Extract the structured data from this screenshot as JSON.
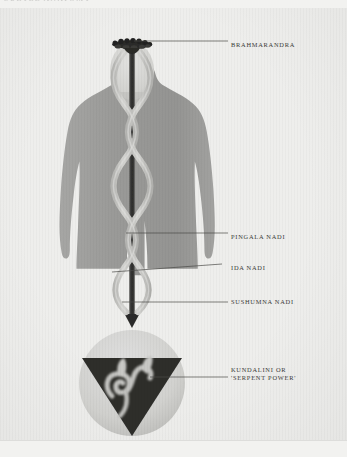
{
  "header": {
    "running_head": "SUBTLE ANATOMY"
  },
  "plate": {
    "title": "The subtle body: nadis and kundalini",
    "colors": {
      "page_background": "#f2f2f0",
      "plate_background": "#eeeeec",
      "body_silhouette": "#9a9a98",
      "head_fill": "#d6d6d4",
      "nadi_strand": "#c9c9c6",
      "sushumna_channel": "#3c3c3a",
      "chakra_circle": "#d4d4d1",
      "triangle": "#2e2e2c",
      "serpent": "#bdbdba",
      "crown_lotus": "#2a2a28",
      "leader_line": "#4a4a48",
      "label_text": "#3a3a38"
    }
  },
  "labels": [
    {
      "id": "brahmarandra",
      "name": "BRAHMARANDRA",
      "lines": [
        "BRAHMARANDRA"
      ],
      "x": 231,
      "y": 38,
      "leader_from_x": 134,
      "leader_from_y": 41,
      "leader_to_x": 228,
      "leader_to_y": 41
    },
    {
      "id": "pingala-nadi",
      "name": "PINGALA NADI",
      "lines": [
        "PINGALA NADI"
      ],
      "x": 231,
      "y": 230,
      "leader_from_x": 126,
      "leader_from_y": 233,
      "leader_to_x": 228,
      "leader_to_y": 233
    },
    {
      "id": "ida-nadi",
      "name": "IDA NADI",
      "lines": [
        "IDA NADI"
      ],
      "x": 231,
      "y": 264,
      "leader_from_x": 118,
      "leader_from_y": 272,
      "leader_to_x": 228,
      "leader_to_y": 266
    },
    {
      "id": "sushumna-nadi",
      "name": "SUSHUMNA NADI",
      "lines": [
        "SUSHUMNA NADI"
      ],
      "x": 231,
      "y": 299,
      "leader_from_x": 122,
      "leader_from_y": 302,
      "leader_to_x": 228,
      "leader_to_y": 302
    },
    {
      "id": "kundalini",
      "name": "KUNDALINI OR 'SERPENT POWER'",
      "lines": [
        "KUNDALINI OR",
        "'SERPENT POWER'"
      ],
      "x": 231,
      "y": 364,
      "leader_from_x": 150,
      "leader_from_y": 377,
      "leader_to_x": 228,
      "leader_to_y": 377
    }
  ],
  "figure": {
    "parts": [
      {
        "id": "body-silhouette",
        "label": "human body silhouette"
      },
      {
        "id": "head",
        "label": "head"
      },
      {
        "id": "crown-lotus",
        "label": "crown lotus at brahmarandra"
      },
      {
        "id": "sushumna",
        "label": "sushumna central channel"
      },
      {
        "id": "ida-strand",
        "label": "ida nadi helical strand"
      },
      {
        "id": "pingala-strand",
        "label": "pingala nadi helical strand"
      },
      {
        "id": "chakra-circle",
        "label": "muladhara chakra circle"
      },
      {
        "id": "chakra-triangle",
        "label": "downward triangle"
      },
      {
        "id": "serpent",
        "label": "coiled serpent kundalini"
      }
    ]
  }
}
